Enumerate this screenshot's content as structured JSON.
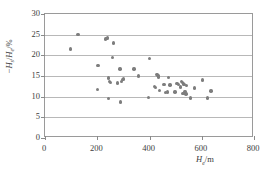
{
  "chart_data": {
    "type": "scatter",
    "title": "",
    "xlabel": "He/m",
    "ylabel": "-Hs/He/%",
    "xlim": [
      0,
      800
    ],
    "ylim": [
      0,
      30
    ],
    "xticks": [
      0,
      200,
      400,
      600,
      800
    ],
    "yticks": [
      0,
      5,
      10,
      15,
      20,
      25,
      30
    ],
    "grid": "horizontal",
    "legend": "none",
    "marker_color": "#7d7d7d",
    "series": [
      {
        "name": "samples",
        "points": [
          [
            97,
            21.5
          ],
          [
            126,
            25.0
          ],
          [
            200,
            11.8
          ],
          [
            203,
            17.6
          ],
          [
            232,
            24.0
          ],
          [
            237,
            24.1
          ],
          [
            240,
            24.3
          ],
          [
            242,
            14.5
          ],
          [
            243,
            9.6
          ],
          [
            247,
            13.7
          ],
          [
            250,
            13.5
          ],
          [
            258,
            19.5
          ],
          [
            263,
            23.0
          ],
          [
            277,
            13.3
          ],
          [
            287,
            16.7
          ],
          [
            289,
            8.7
          ],
          [
            292,
            13.6
          ],
          [
            296,
            14.2
          ],
          [
            300,
            14.3
          ],
          [
            340,
            16.7
          ],
          [
            358,
            15.0
          ],
          [
            396,
            9.8
          ],
          [
            400,
            19.3
          ],
          [
            418,
            12.5
          ],
          [
            423,
            12.2
          ],
          [
            428,
            15.4
          ],
          [
            432,
            15.1
          ],
          [
            435,
            14.8
          ],
          [
            438,
            11.5
          ],
          [
            455,
            13.0
          ],
          [
            462,
            11.0
          ],
          [
            468,
            11.1
          ],
          [
            472,
            14.6
          ],
          [
            478,
            12.8
          ],
          [
            497,
            11.1
          ],
          [
            505,
            13.2
          ],
          [
            512,
            13.0
          ],
          [
            518,
            12.3
          ],
          [
            522,
            13.6
          ],
          [
            526,
            13.4
          ],
          [
            528,
            10.8
          ],
          [
            531,
            13.1
          ],
          [
            533,
            12.9
          ],
          [
            536,
            11.2
          ],
          [
            539,
            10.6
          ],
          [
            541,
            12.7
          ],
          [
            556,
            9.7
          ],
          [
            573,
            12.1
          ],
          [
            603,
            14.0
          ],
          [
            622,
            9.7
          ],
          [
            635,
            11.4
          ]
        ]
      }
    ]
  },
  "axes": {
    "y_title_parts": {
      "minus": "−",
      "h": "H",
      "s": "s",
      "slash1": "/",
      "h2": "H",
      "e": "e",
      "unit": "/%"
    },
    "x_title_parts": {
      "h": "H",
      "e": "e",
      "unit": "/m"
    }
  }
}
